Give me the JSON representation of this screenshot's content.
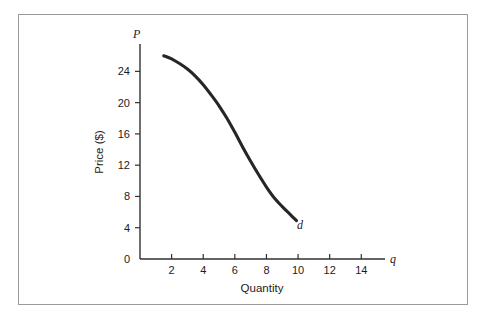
{
  "chart_data": {
    "type": "line",
    "title": "",
    "subtitle": "",
    "xlabel": "Quantity",
    "ylabel": "Price ($)",
    "x_axis_symbol": "q",
    "y_axis_symbol": "P",
    "curve_label": "d",
    "curve_label_meaning": "demand curve",
    "xlim": [
      0,
      15.5
    ],
    "ylim": [
      0,
      27.5
    ],
    "x_ticks": [
      2,
      4,
      6,
      8,
      10,
      12,
      14
    ],
    "x_tick_labels": [
      "2",
      "4",
      "6",
      "8",
      "10",
      "12",
      "14"
    ],
    "y_ticks": [
      0,
      4,
      8,
      12,
      16,
      20,
      24
    ],
    "y_tick_labels": [
      "0",
      "4",
      "8",
      "12",
      "16",
      "20",
      "24"
    ],
    "origin_label": "0",
    "grid": false,
    "legend": "none",
    "series": [
      {
        "name": "d",
        "points": [
          {
            "q": 1.5,
            "p": 26.0
          },
          {
            "q": 2.0,
            "p": 25.6
          },
          {
            "q": 2.5,
            "p": 25.0
          },
          {
            "q": 3.0,
            "p": 24.3
          },
          {
            "q": 3.5,
            "p": 23.4
          },
          {
            "q": 4.0,
            "p": 22.3
          },
          {
            "q": 4.5,
            "p": 21.0
          },
          {
            "q": 5.0,
            "p": 19.6
          },
          {
            "q": 5.5,
            "p": 18.0
          },
          {
            "q": 6.0,
            "p": 16.2
          },
          {
            "q": 6.5,
            "p": 14.3
          },
          {
            "q": 7.0,
            "p": 12.5
          },
          {
            "q": 7.5,
            "p": 10.8
          },
          {
            "q": 8.0,
            "p": 9.2
          },
          {
            "q": 8.5,
            "p": 7.8
          },
          {
            "q": 9.0,
            "p": 6.7
          },
          {
            "q": 9.5,
            "p": 5.7
          },
          {
            "q": 9.9,
            "p": 4.9
          }
        ]
      }
    ],
    "colors": {
      "curve": "#262626",
      "axis": "#303030",
      "text": "#1c1c1c",
      "border": "#9a9a9a",
      "background": "#ffffff"
    }
  }
}
